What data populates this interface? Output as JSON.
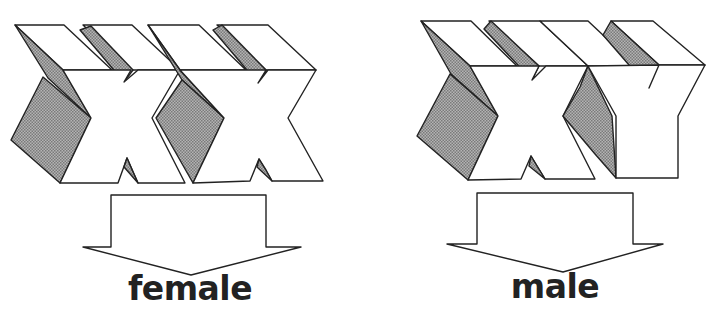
{
  "diagram": {
    "colors": {
      "outline": "#222222",
      "face": "#ffffff",
      "shade": "#9a9a9a",
      "text": "#222222"
    },
    "groups": [
      {
        "id": "female",
        "letters": [
          "X",
          "X"
        ],
        "chromosomes": "XX",
        "arrow_direction": "down",
        "label": "female"
      },
      {
        "id": "male",
        "letters": [
          "X",
          "Y"
        ],
        "chromosomes": "XY",
        "arrow_direction": "down",
        "label": "male"
      }
    ]
  }
}
